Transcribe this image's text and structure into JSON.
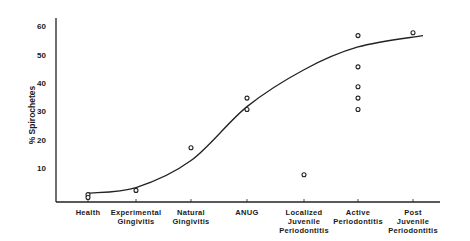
{
  "chart_data": {
    "type": "scatter",
    "title": "",
    "xlabel": "",
    "ylabel": "% Spirochetes",
    "ylim": [
      0,
      60
    ],
    "yticks": [
      10,
      20,
      30,
      40,
      50,
      60
    ],
    "grid": false,
    "legend": null,
    "categories": [
      "Health",
      "Experimental Gingivitis",
      "Natural Gingivitis",
      "ANUG",
      "Localized Juvenile Periodontitis",
      "Active Periodontitis",
      "Post Juvenile Periodontitis"
    ],
    "series": [
      {
        "name": "observations",
        "marker": "open-circle",
        "points": [
          {
            "category": "Health",
            "values": [
              1,
              0
            ]
          },
          {
            "category": "Experimental Gingivitis",
            "values": [
              2.5
            ]
          },
          {
            "category": "Natural Gingivitis",
            "values": [
              17.5
            ]
          },
          {
            "category": "ANUG",
            "values": [
              35,
              31
            ]
          },
          {
            "category": "Localized Juvenile Periodontitis",
            "values": [
              8
            ]
          },
          {
            "category": "Active Periodontitis",
            "values": [
              57,
              46,
              39,
              35,
              31
            ]
          },
          {
            "category": "Post Juvenile Periodontitis",
            "values": [
              58
            ]
          }
        ]
      },
      {
        "name": "fitted sigmoid curve",
        "type": "line",
        "x": [
          "Health",
          "Experimental Gingivitis",
          "Natural Gingivitis",
          "ANUG",
          "Localized Juvenile Periodontitis",
          "Active Periodontitis",
          "Post Juvenile Periodontitis"
        ],
        "values": [
          1.5,
          3.5,
          13,
          32,
          45,
          53,
          57
        ]
      }
    ]
  },
  "labels": {
    "ylabel": "% Spirochetes",
    "yticks": [
      "10",
      "20",
      "30",
      "40",
      "50",
      "60"
    ],
    "x": [
      [
        "Health"
      ],
      [
        "Experimental",
        "Gingivitis"
      ],
      [
        "Natural",
        "Gingivitis"
      ],
      [
        "ANUG"
      ],
      [
        "Localized",
        "Juvenile",
        "Periodontitis"
      ],
      [
        "Active",
        "Periodontitis"
      ],
      [
        "Post",
        "Juvenile",
        "Periodontitis"
      ]
    ]
  }
}
